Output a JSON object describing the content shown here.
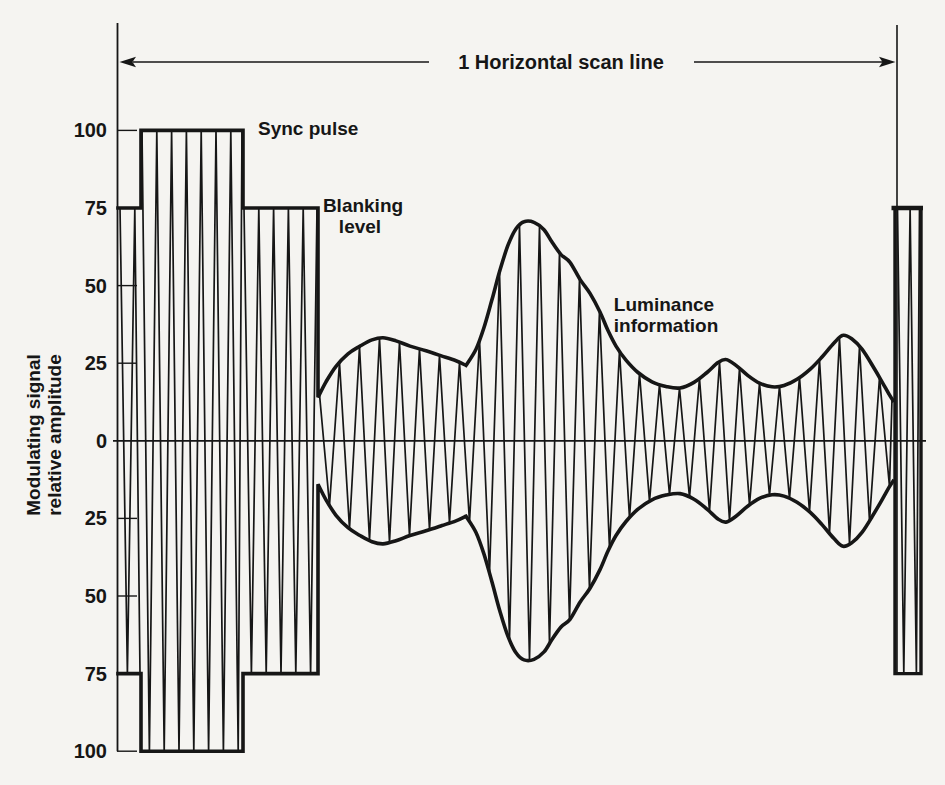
{
  "figure": {
    "arrow_label": "1 Horizontal scan line",
    "annotations": {
      "sync": "Sync pulse",
      "blanking_line1": "Blanking",
      "blanking_line2": "level",
      "luminance_line1": "Luminance",
      "luminance_line2": "information"
    },
    "y_axis": {
      "label_line1": "Modulating signal",
      "label_line2": "relative amplitude"
    },
    "ink_color": "#161616",
    "paper_color": "#f5f4f1"
  },
  "chart_data": {
    "type": "area",
    "ylabel": "Modulating signal relative amplitude",
    "xlabel": "1 Horizontal scan line",
    "ylim": [
      -115,
      115
    ],
    "grid": false,
    "y_ticks": [
      {
        "label": "100",
        "value": 100
      },
      {
        "label": "75",
        "value": 75
      },
      {
        "label": "50",
        "value": 50
      },
      {
        "label": "25",
        "value": 25
      },
      {
        "label": "0",
        "value": 0
      },
      {
        "label": "25",
        "value": -25
      },
      {
        "label": "50",
        "value": -50
      },
      {
        "label": "75",
        "value": -75
      },
      {
        "label": "100",
        "value": -100
      }
    ],
    "annotations": [
      {
        "text": "Sync pulse",
        "points_to": "sync pulse top at amplitude 100"
      },
      {
        "text": "Blanking level",
        "points_to": "blanking pedestal at amplitude 75"
      },
      {
        "text": "Luminance information",
        "points_to": "varying video envelope"
      },
      {
        "text": "1 Horizontal scan line",
        "points_to": "full span between line boundaries"
      }
    ],
    "envelope": {
      "symmetric_about_zero": true,
      "segments": [
        {
          "name": "front-blanking",
          "x_px": [
            118,
            141
          ],
          "amplitude": 75
        },
        {
          "name": "sync-pulse",
          "x_px": [
            141,
            243
          ],
          "amplitude": 100
        },
        {
          "name": "back-blanking",
          "x_px": [
            243,
            318
          ],
          "amplitude": 75
        },
        {
          "name": "luminance",
          "points_px_amp": [
            [
              318,
              14
            ],
            [
              326,
              19
            ],
            [
              336,
              24
            ],
            [
              348,
              28
            ],
            [
              360,
              30.5
            ],
            [
              372,
              32.5
            ],
            [
              383,
              33.2
            ],
            [
              396,
              32.2
            ],
            [
              410,
              30.5
            ],
            [
              426,
              29
            ],
            [
              442,
              27.3
            ],
            [
              456,
              25.8
            ],
            [
              466,
              24.3
            ],
            [
              476,
              29.5
            ],
            [
              484,
              36.5
            ],
            [
              492,
              45.5
            ],
            [
              500,
              55
            ],
            [
              508,
              63
            ],
            [
              516,
              68.3
            ],
            [
              524,
              70.6
            ],
            [
              534,
              70.4
            ],
            [
              544,
              68
            ],
            [
              552,
              64
            ],
            [
              561,
              60
            ],
            [
              570,
              57.5
            ],
            [
              580,
              52
            ],
            [
              590,
              47.5
            ],
            [
              600,
              41.5
            ],
            [
              608,
              35.5
            ],
            [
              616,
              30.5
            ],
            [
              626,
              26
            ],
            [
              638,
              22
            ],
            [
              652,
              19
            ],
            [
              666,
              17.5
            ],
            [
              680,
              17
            ],
            [
              694,
              18.8
            ],
            [
              707,
              22
            ],
            [
              718,
              25.2
            ],
            [
              726,
              26.2
            ],
            [
              736,
              24.3
            ],
            [
              748,
              21
            ],
            [
              760,
              18.5
            ],
            [
              772,
              17.4
            ],
            [
              784,
              17.8
            ],
            [
              797,
              19.8
            ],
            [
              810,
              23
            ],
            [
              822,
              27
            ],
            [
              834,
              31.5
            ],
            [
              843,
              34
            ],
            [
              852,
              32.8
            ],
            [
              862,
              29.5
            ],
            [
              872,
              24.5
            ],
            [
              882,
              19
            ],
            [
              889,
              15
            ],
            [
              893,
              13
            ]
          ],
          "cusp_x_px": 466
        },
        {
          "name": "end-blanking-bar",
          "x_px": [
            895,
            921
          ],
          "amplitude": 75
        }
      ]
    },
    "carrier": {
      "appearance": "dense near-vertical zigzag fill between envelopes"
    }
  }
}
